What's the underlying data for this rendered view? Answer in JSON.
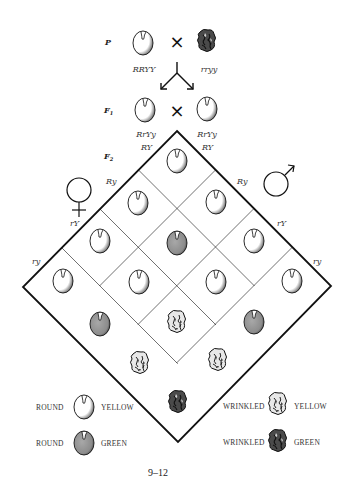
{
  "figure": {
    "number": "9–12",
    "generations": {
      "p_label": "P",
      "f1_label": "F",
      "f1_sub": "1",
      "f2_label": "F",
      "f2_sub": "2"
    },
    "parents": {
      "left_genotype": "RRYY",
      "right_genotype": "rryy",
      "left_phenotype": "round-yellow",
      "right_phenotype": "wrinkled-green",
      "cross_symbol": "×"
    },
    "f1": {
      "left_genotype": "RrYy",
      "right_genotype": "RrYy",
      "left_phenotype": "round-yellow",
      "right_phenotype": "round-yellow",
      "cross_symbol": "×"
    },
    "female_symbol": "♀",
    "male_symbol": "♂",
    "female_gametes": [
      "RY",
      "Ry",
      "rY",
      "ry"
    ],
    "male_gametes": [
      "RY",
      "Ry",
      "rY",
      "ry"
    ],
    "punnett_rows": [
      [
        "round-yellow",
        "round-yellow",
        "round-yellow",
        "round-yellow"
      ],
      [
        "round-yellow",
        "round-green",
        "round-yellow",
        "round-green"
      ],
      [
        "round-yellow",
        "round-yellow",
        "wrinkled-yellow",
        "wrinkled-yellow"
      ],
      [
        "round-yellow",
        "round-green",
        "wrinkled-yellow",
        "wrinkled-green"
      ]
    ],
    "legend": [
      {
        "shape": "ROUND",
        "color": "YELLOW",
        "phenotype": "round-yellow"
      },
      {
        "shape": "ROUND",
        "color": "GREEN",
        "phenotype": "round-green"
      },
      {
        "shape": "WRINKLED",
        "color": "YELLOW",
        "phenotype": "wrinkled-yellow"
      },
      {
        "shape": "WRINKLED",
        "color": "GREEN",
        "phenotype": "wrinkled-green"
      }
    ],
    "colors": {
      "line": "#111111",
      "pea_yellow_fill": "#ffffff",
      "pea_green_fill": "#8f8f8f",
      "wrinkled_dark": "#3a3a3a",
      "text": "#333333"
    }
  }
}
